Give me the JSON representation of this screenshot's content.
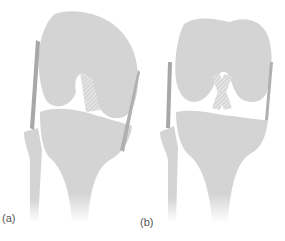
{
  "figure": {
    "panels": [
      {
        "id": "a",
        "label": "(a)",
        "description": "knee joint, flexed/rotated view with cruciate ligaments crossing"
      },
      {
        "id": "b",
        "label": "(b)",
        "description": "knee joint, anterior view with crossed cruciate ligaments"
      }
    ],
    "colors": {
      "bone": "#d4d4d4",
      "ligament": "#a8a8a8",
      "background": "#ffffff",
      "label": "#555555"
    }
  }
}
